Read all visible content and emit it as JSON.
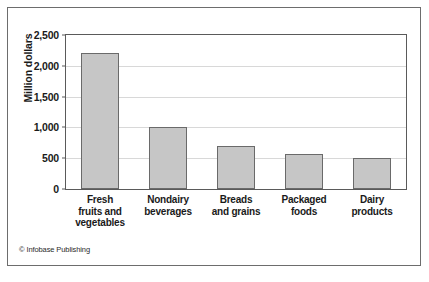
{
  "figure": {
    "credit": "© Infobase Publishing",
    "border_color": "#6d6d6d",
    "background": "#ffffff"
  },
  "chart_data": {
    "type": "bar",
    "title": "",
    "xlabel": "",
    "ylabel": "Million dollars",
    "categories": [
      "Fresh fruits and vegetables",
      "Nondairy beverages",
      "Breads and grains",
      "Packaged foods",
      "Dairy products"
    ],
    "category_lines": [
      [
        "Fresh",
        "fruits and",
        "vegetables"
      ],
      [
        "Nondairy",
        "beverages"
      ],
      [
        "Breads",
        "and grains"
      ],
      [
        "Packaged",
        "foods"
      ],
      [
        "Dairy",
        "products"
      ]
    ],
    "values": [
      2200,
      1000,
      700,
      575,
      500
    ],
    "ylim": [
      0,
      2500
    ],
    "ytick_values": [
      0,
      500,
      1000,
      1500,
      2000,
      2500
    ],
    "ytick_labels": [
      "0",
      "500",
      "1,000",
      "1,500",
      "2,000",
      "2,500"
    ],
    "grid": true,
    "legend": false,
    "bar_color": "#c6c6c6",
    "bar_edge_color": "#6a6a6a",
    "gridline_color": "#d8d8d8"
  }
}
